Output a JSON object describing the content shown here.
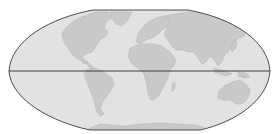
{
  "map": {
    "projection": "flat-polar pseudocylindrical world map",
    "colors": {
      "background": "#ffffff",
      "ocean": "#e2e2e2",
      "land": "#c9c9c9",
      "land_edge": "#b4b4b4",
      "outline": "#3a3a3a",
      "equator": "#2e2e2e"
    },
    "features": {
      "equator_line": true,
      "graticule": false
    },
    "regions": [
      "north-america",
      "greenland",
      "south-america",
      "europe",
      "africa",
      "madagascar",
      "asia",
      "japan",
      "indonesia",
      "new-guinea",
      "australia",
      "new-zealand",
      "antarctica"
    ]
  }
}
